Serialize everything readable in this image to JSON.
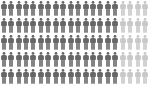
{
  "chart_data": {
    "type": "pictograph",
    "title": "",
    "total": 100,
    "rows": 5,
    "columns": 20,
    "highlighted": 80,
    "not_highlighted": 20,
    "categories": [
      "highlighted",
      "other"
    ],
    "values": [
      80,
      20
    ],
    "legend": [],
    "colors": {
      "highlighted": "#666666",
      "other": "#c8c8c8"
    },
    "layout": "each row: 16 highlighted figures followed by 4 light figures",
    "icon": "person-icon"
  }
}
